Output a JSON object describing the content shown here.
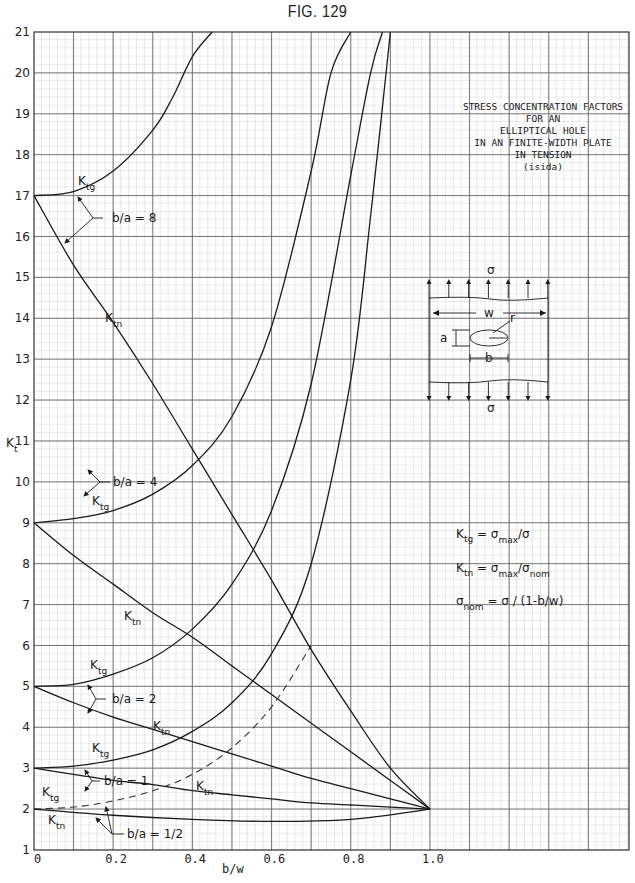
{
  "figure": {
    "title": "FIG. 129"
  },
  "chart_data": {
    "type": "line",
    "title": "STRESS CONCENTRATION FACTORS FOR AN ELLIPTICAL HOLE IN AN FINITE-WIDTH PLATE IN TENSION (isida)",
    "xlabel": "b/w",
    "ylabel": "Kt",
    "xlim": [
      0,
      1.5
    ],
    "ylim": [
      1,
      21
    ],
    "grid": true,
    "x_ticks": [
      "0",
      "0.2",
      "0.4",
      "0.6",
      "0.8",
      "1.0"
    ],
    "y_ticks": [
      "1",
      "2",
      "3",
      "4",
      "5",
      "6",
      "7",
      "8",
      "9",
      "10",
      "11",
      "12",
      "13",
      "14",
      "15",
      "16",
      "17",
      "18",
      "19",
      "20",
      "21"
    ],
    "series": [
      {
        "name": "Ktg b/a=8",
        "x": [
          0,
          0.1,
          0.2,
          0.3,
          0.35,
          0.4,
          0.45
        ],
        "y": [
          17.0,
          17.1,
          17.6,
          18.6,
          19.4,
          20.4,
          21.0
        ]
      },
      {
        "name": "Ktn b/a=8",
        "x": [
          0,
          0.1,
          0.2,
          0.3,
          0.4,
          0.5,
          0.6,
          0.7,
          0.8,
          0.9,
          1.0
        ],
        "y": [
          17.0,
          15.3,
          13.9,
          12.4,
          10.8,
          9.2,
          7.6,
          5.9,
          4.4,
          3.0,
          2.0
        ]
      },
      {
        "name": "Ktg b/a=4",
        "x": [
          0,
          0.1,
          0.2,
          0.3,
          0.4,
          0.5,
          0.6,
          0.7,
          0.75,
          0.8
        ],
        "y": [
          9.0,
          9.1,
          9.3,
          9.7,
          10.4,
          11.6,
          13.8,
          17.6,
          20.0,
          21.0
        ]
      },
      {
        "name": "Ktn b/a=4",
        "x": [
          0,
          0.1,
          0.2,
          0.3,
          0.4,
          0.5,
          0.6,
          0.7,
          0.8,
          0.9,
          1.0
        ],
        "y": [
          9.0,
          8.2,
          7.5,
          6.8,
          6.2,
          5.5,
          4.8,
          4.1,
          3.4,
          2.7,
          2.0
        ]
      },
      {
        "name": "Ktg b/a=2",
        "x": [
          0,
          0.1,
          0.2,
          0.3,
          0.4,
          0.5,
          0.6,
          0.7,
          0.8,
          0.85,
          0.88
        ],
        "y": [
          5.0,
          5.05,
          5.3,
          5.7,
          6.4,
          7.5,
          9.3,
          12.4,
          17.5,
          20.0,
          21.0
        ]
      },
      {
        "name": "Ktn b/a=2",
        "x": [
          0,
          0.1,
          0.2,
          0.3,
          0.4,
          0.5,
          0.6,
          0.7,
          0.8,
          0.9,
          1.0
        ],
        "y": [
          5.0,
          4.6,
          4.25,
          3.95,
          3.65,
          3.35,
          3.05,
          2.75,
          2.5,
          2.25,
          2.0
        ]
      },
      {
        "name": "Ktg b/a=1",
        "x": [
          0,
          0.1,
          0.2,
          0.3,
          0.4,
          0.5,
          0.6,
          0.7,
          0.8,
          0.85,
          0.9
        ],
        "y": [
          3.0,
          3.05,
          3.2,
          3.45,
          3.9,
          4.6,
          5.8,
          8.0,
          12.5,
          16.5,
          21.0
        ]
      },
      {
        "name": "Ktn b/a=1",
        "x": [
          0,
          0.1,
          0.2,
          0.3,
          0.4,
          0.5,
          0.6,
          0.7,
          0.8,
          0.9,
          1.0
        ],
        "y": [
          3.0,
          2.85,
          2.7,
          2.6,
          2.45,
          2.35,
          2.25,
          2.15,
          2.1,
          2.05,
          2.0
        ]
      },
      {
        "name": "Ktg b/a=1/2",
        "x": [
          0,
          0.1,
          0.2,
          0.3,
          0.4,
          0.5,
          0.6,
          0.7
        ],
        "y": [
          2.0,
          2.05,
          2.2,
          2.45,
          2.85,
          3.5,
          4.5,
          6.0
        ],
        "style": "dashed"
      },
      {
        "name": "Ktn b/a=1/2",
        "x": [
          0,
          0.2,
          0.4,
          0.6,
          0.8,
          1.0
        ],
        "y": [
          2.0,
          1.85,
          1.75,
          1.7,
          1.75,
          2.0
        ]
      }
    ],
    "annotations": [
      {
        "text": "b/a = 8",
        "near": [
          0.25,
          16.5
        ]
      },
      {
        "text": "b/a = 4",
        "near": [
          0.2,
          8.5
        ]
      },
      {
        "text": "b/a = 2",
        "near": [
          0.2,
          4.5
        ]
      },
      {
        "text": "b/a = 1",
        "near": [
          0.2,
          2.7
        ]
      },
      {
        "text": "b/a = 1/2",
        "near": [
          0.25,
          1.3
        ]
      },
      {
        "text": "Ktg = σmax/σ"
      },
      {
        "text": "Ktn = σmax/σnom"
      },
      {
        "text": "σnom = σ/(1-b/w)"
      }
    ]
  },
  "labels": {
    "ylabel_main": "K",
    "ylabel_sub": "t",
    "xlabel": "b/w",
    "k_main": "K",
    "ktg_sub": "tg",
    "ktn_sub": "tn",
    "ba8": "b/a = 8",
    "ba4": "b/a = 4",
    "ba2": "b/a = 2",
    "ba1": "b/a = 1",
    "ba_half": "b/a = 1/2"
  },
  "title_block": {
    "line1": "STRESS CONCENTRATION FACTORS",
    "line2": "FOR AN",
    "line3": "ELLIPTICAL HOLE",
    "line4": "IN AN FINITE-WIDTH PLATE",
    "line5": "IN TENSION",
    "line6": "(isida)"
  },
  "diagram": {
    "sigma": "σ",
    "w": "w",
    "a": "a",
    "b": "b",
    "r": "r"
  },
  "formulas": {
    "f1_lhs_main": "K",
    "f1_lhs_sub": "tg",
    "f1_eq": " = σ",
    "f1_sub": "max",
    "f1_tail": "/σ",
    "f2_lhs_main": "K",
    "f2_lhs_sub": "tn",
    "f2_eq": " = σ",
    "f2_sub": "max",
    "f2_tail": "/σ",
    "f2_tail_sub": "nom",
    "f3_lhs_main": "σ",
    "f3_lhs_sub": "nom",
    "f3_tail": " = σ / (1-b/w)"
  }
}
